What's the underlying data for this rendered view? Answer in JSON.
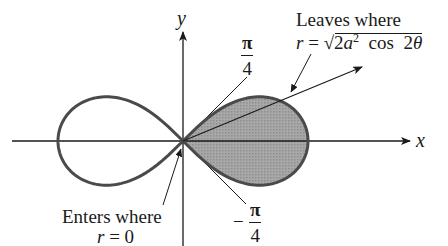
{
  "figure": {
    "type": "polar-curve-diagram",
    "curve": "lemniscate",
    "equation": "r^2 = 2a^2 cos 2θ",
    "colors": {
      "curve": "#4a4a4a",
      "axes": "#1a1a1a",
      "shaded_region": "#9a9a9a",
      "background": "#ffffff"
    },
    "axes": {
      "x_label": "x",
      "y_label": "y"
    },
    "angle_labels": {
      "upper": {
        "numerator": "π",
        "denominator": "4",
        "sign": ""
      },
      "lower": {
        "numerator": "π",
        "denominator": "4",
        "sign": "−"
      }
    },
    "annotations": {
      "leaves": {
        "line1": "Leaves where",
        "r_symbol": "r",
        "equals": " = ",
        "radicand_prefix": "2a",
        "radicand_exponent": "2",
        "radicand_suffix": " cos 2θ"
      },
      "enters": {
        "line1": "Enters where",
        "line2_symbol": "r",
        "line2_rest": " = 0"
      }
    },
    "shaded_region": "right lobe, −π/4 ≤ θ ≤ π/4"
  }
}
